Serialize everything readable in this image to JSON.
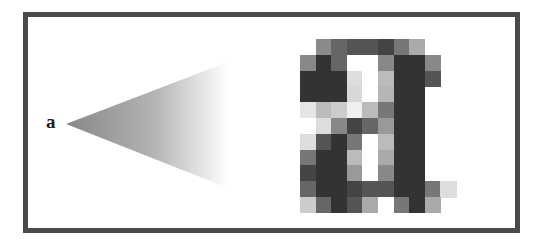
{
  "diagram": {
    "title_label": "a",
    "frame": {
      "border_color": "#4a4a4a",
      "background": "#ffffff"
    },
    "cone": {
      "description": "magnification cone from small letter to enlarged pixel grid",
      "apex": [
        66,
        124
      ],
      "top_right": [
        228,
        62
      ],
      "bottom_right": [
        228,
        188
      ],
      "gradient_start": "#888888",
      "gradient_end": "#ffffff"
    },
    "magnified_glyph": {
      "character": "a",
      "origin": [
        300,
        39
      ],
      "cell_width": 15.6,
      "cell_height": 15.8,
      "columns": 10,
      "rows": 11,
      "pixels": [
        [
          null,
          "#8a8a8a",
          "#666666",
          "#555555",
          "#555555",
          "#444444",
          "#777777",
          "#aaaaaa",
          null,
          null
        ],
        [
          "#888888",
          "#333333",
          "#666666",
          "#ffffff",
          "#ffffff",
          "#888888",
          "#333333",
          "#333333",
          "#888888",
          null
        ],
        [
          "#333333",
          "#333333",
          "#333333",
          "#dddddd",
          "#ffffff",
          "#bbbbbb",
          "#333333",
          "#333333",
          "#555555",
          null
        ],
        [
          "#333333",
          "#333333",
          "#333333",
          "#d8d8d8",
          "#ffffff",
          "#b5b5b5",
          "#333333",
          "#333333",
          null,
          null
        ],
        [
          "#e5e5e5",
          "#bbbbbb",
          "#cccccc",
          "#f0f0f0",
          "#bbbbbb",
          "#777777",
          "#333333",
          "#333333",
          null,
          null
        ],
        [
          "#ffffff",
          "#dddddd",
          "#888888",
          "#444444",
          "#666666",
          "#999999",
          "#333333",
          "#333333",
          null,
          null
        ],
        [
          "#dddddd",
          "#555555",
          "#333333",
          "#777777",
          "#ffffff",
          "#bbbbbb",
          "#333333",
          "#333333",
          null,
          null
        ],
        [
          "#777777",
          "#333333",
          "#333333",
          "#bbbbbb",
          "#ffffff",
          "#aaaaaa",
          "#333333",
          "#333333",
          null,
          null
        ],
        [
          "#444444",
          "#333333",
          "#333333",
          "#999999",
          "#ffffff",
          "#888888",
          "#333333",
          "#333333",
          null,
          null
        ],
        [
          "#666666",
          "#333333",
          "#333333",
          "#444444",
          "#555555",
          "#555555",
          "#333333",
          "#333333",
          "#777777",
          "#dddddd"
        ],
        [
          "#cccccc",
          "#666666",
          "#333333",
          "#555555",
          "#aaaaaa",
          "#ffffff",
          "#777777",
          "#333333",
          "#aaaaaa",
          null
        ]
      ]
    }
  }
}
